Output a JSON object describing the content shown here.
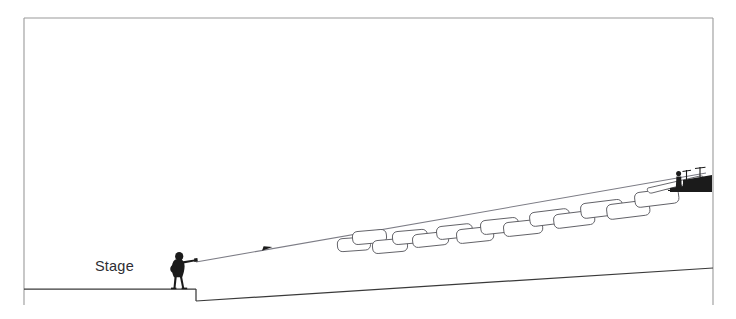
{
  "diagram": {
    "kind": "sound-system-coverage-section",
    "background_color": "#ffffff",
    "frame": {
      "color": "#9a9a9a",
      "x": 24,
      "y": 18,
      "width": 689,
      "height": 287,
      "sides_drawn": [
        "top",
        "left",
        "right"
      ]
    },
    "labels": {
      "stage": "Stage"
    },
    "label_positions": {
      "stage": {
        "x": 95,
        "y": 271
      }
    },
    "colors": {
      "frame": "#9a9a9a",
      "ground": "#3a3a3a",
      "ray": "#7d7d86",
      "box_stroke": "#58585e",
      "box_fill": "#ffffff",
      "silhouette": "#1b1b1b",
      "text": "#2e2e33"
    },
    "stage": {
      "top_y": 289,
      "left_x": 24,
      "edge_x": 196,
      "drop_bottom_y": 301
    },
    "ground_slope": {
      "start": {
        "x": 196,
        "y": 301
      },
      "end": {
        "x": 713,
        "y": 268
      },
      "description": "raked audience floor rising toward rear"
    },
    "ray": {
      "start": {
        "x": 196,
        "y": 262
      },
      "end": {
        "x": 706,
        "y": 173
      },
      "arrow_at": {
        "x": 268,
        "y": 249
      },
      "description": "main axis of sound projection from stage to rear mix position"
    },
    "coverage_boxes": {
      "count": 14,
      "description": "overlapping rounded rectangles representing successive loudspeaker coverage zones climbing the rake",
      "items": [
        {
          "x": 337,
          "y": 239,
          "w": 33,
          "h": 13,
          "rot": -4
        },
        {
          "x": 352,
          "y": 233,
          "w": 34,
          "h": 13,
          "rot": -5
        },
        {
          "x": 372,
          "y": 242,
          "w": 35,
          "h": 13,
          "rot": -5
        },
        {
          "x": 392,
          "y": 233,
          "w": 35,
          "h": 13,
          "rot": -5
        },
        {
          "x": 412,
          "y": 236,
          "w": 36,
          "h": 13,
          "rot": -6
        },
        {
          "x": 436,
          "y": 228,
          "w": 36,
          "h": 13,
          "rot": -6
        },
        {
          "x": 456,
          "y": 231,
          "w": 37,
          "h": 14,
          "rot": -6
        },
        {
          "x": 480,
          "y": 222,
          "w": 38,
          "h": 14,
          "rot": -6
        },
        {
          "x": 503,
          "y": 224,
          "w": 39,
          "h": 14,
          "rot": -6
        },
        {
          "x": 529,
          "y": 214,
          "w": 40,
          "h": 14,
          "rot": -7
        },
        {
          "x": 553,
          "y": 216,
          "w": 41,
          "h": 14,
          "rot": -7
        },
        {
          "x": 580,
          "y": 205,
          "w": 42,
          "h": 15,
          "rot": -7
        },
        {
          "x": 606,
          "y": 206,
          "w": 43,
          "h": 15,
          "rot": -7
        },
        {
          "x": 634,
          "y": 194,
          "w": 44,
          "h": 15,
          "rot": -7
        }
      ]
    },
    "performer": {
      "x": 170,
      "y": 252,
      "description": "silhouette of guitarist on stage, arm extended toward audience"
    },
    "front_of_house": {
      "x": 668,
      "y": 168,
      "description": "dark silhouette of rear mix position platform with engineer and mast poles"
    }
  }
}
